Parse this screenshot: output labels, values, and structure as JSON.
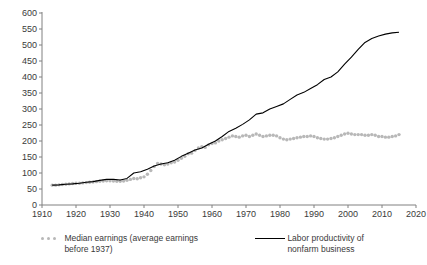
{
  "chart_data": {
    "type": "line",
    "title": "",
    "xlabel": "",
    "ylabel": "Normalized to 1937 = 100",
    "xlim": [
      1910,
      2020
    ],
    "ylim": [
      0,
      600
    ],
    "ytick_step": 50,
    "xtick_step": 10,
    "grid": false,
    "legend_position": "bottom",
    "yticks": [
      "0",
      "50",
      "100",
      "150",
      "200",
      "250",
      "300",
      "350",
      "400",
      "450",
      "500",
      "550",
      "600"
    ],
    "xticks": [
      "1910",
      "1920",
      "1930",
      "1940",
      "1950",
      "1960",
      "1970",
      "1980",
      "1990",
      "2000",
      "2010",
      "2020"
    ],
    "series": [
      {
        "name": "Median earnings (average earnings before 1937)",
        "style": "dotted-markers",
        "color": "#b8b8b8",
        "x": [
          1913,
          1914,
          1915,
          1916,
          1917,
          1918,
          1919,
          1920,
          1921,
          1922,
          1923,
          1924,
          1925,
          1926,
          1927,
          1928,
          1929,
          1930,
          1931,
          1932,
          1933,
          1934,
          1935,
          1936,
          1937,
          1938,
          1939,
          1940,
          1941,
          1942,
          1943,
          1944,
          1945,
          1946,
          1947,
          1948,
          1949,
          1950,
          1951,
          1952,
          1953,
          1954,
          1955,
          1956,
          1957,
          1958,
          1959,
          1960,
          1961,
          1962,
          1963,
          1964,
          1965,
          1966,
          1967,
          1968,
          1969,
          1970,
          1971,
          1972,
          1973,
          1974,
          1975,
          1976,
          1977,
          1978,
          1979,
          1980,
          1981,
          1982,
          1983,
          1984,
          1985,
          1986,
          1987,
          1988,
          1989,
          1990,
          1991,
          1992,
          1993,
          1994,
          1995,
          1996,
          1997,
          1998,
          1999,
          2000,
          2001,
          2002,
          2003,
          2004,
          2005,
          2006,
          2007,
          2008,
          2009,
          2010,
          2011,
          2012,
          2013,
          2014,
          2015
        ],
        "y": [
          62,
          62,
          63,
          64,
          65,
          66,
          67,
          68,
          68,
          69,
          70,
          71,
          72,
          73,
          74,
          75,
          76,
          76,
          75,
          74,
          74,
          75,
          77,
          80,
          83,
          82,
          85,
          88,
          96,
          108,
          120,
          130,
          128,
          126,
          128,
          132,
          134,
          140,
          146,
          152,
          160,
          162,
          170,
          178,
          182,
          180,
          188,
          192,
          194,
          200,
          204,
          208,
          212,
          216,
          214,
          212,
          216,
          218,
          214,
          218,
          222,
          218,
          214,
          216,
          218,
          218,
          216,
          210,
          206,
          204,
          206,
          208,
          210,
          212,
          214,
          214,
          216,
          214,
          210,
          208,
          206,
          206,
          208,
          210,
          214,
          218,
          222,
          224,
          222,
          220,
          220,
          220,
          218,
          218,
          220,
          218,
          214,
          214,
          212,
          212,
          214,
          216,
          220
        ]
      },
      {
        "name": "Labor productivity of nonfarm business",
        "style": "solid-line",
        "color": "#000000",
        "x": [
          1913,
          1915,
          1917,
          1919,
          1921,
          1923,
          1925,
          1927,
          1929,
          1931,
          1933,
          1935,
          1937,
          1939,
          1941,
          1943,
          1945,
          1947,
          1949,
          1951,
          1953,
          1955,
          1957,
          1959,
          1961,
          1963,
          1965,
          1967,
          1969,
          1971,
          1973,
          1975,
          1977,
          1979,
          1981,
          1983,
          1985,
          1987,
          1989,
          1991,
          1993,
          1995,
          1997,
          1999,
          2001,
          2003,
          2005,
          2007,
          2009,
          2011,
          2013,
          2015
        ],
        "y": [
          62,
          63,
          65,
          66,
          68,
          71,
          73,
          77,
          80,
          80,
          78,
          83,
          100,
          104,
          112,
          122,
          128,
          132,
          140,
          152,
          162,
          172,
          178,
          190,
          200,
          214,
          230,
          240,
          252,
          266,
          284,
          288,
          300,
          308,
          316,
          330,
          344,
          352,
          364,
          376,
          392,
          400,
          416,
          440,
          462,
          486,
          508,
          520,
          528,
          534,
          538,
          540
        ]
      }
    ]
  },
  "legend": {
    "entries": [
      {
        "label_line1": "Median earnings (average earnings",
        "label_line2": "before 1937)",
        "marker": "dotted-markers-icon"
      },
      {
        "label_line1": "Labor productivity of",
        "label_line2": "nonfarm business",
        "marker": "solid-line-icon"
      }
    ]
  }
}
